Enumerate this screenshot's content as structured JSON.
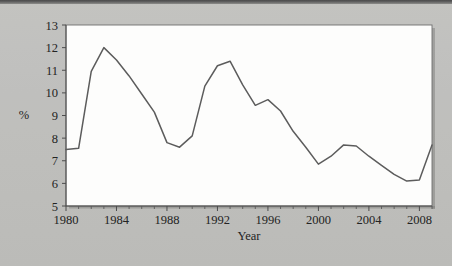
{
  "figure": {
    "background_color": "#bcbcb9",
    "plot_background_color": "#fdfdfc",
    "line_color": "#5c5c5c",
    "axis_color": "#4d4d4d"
  },
  "chart_data": {
    "type": "line",
    "title": "",
    "subtitle": "",
    "xlabel": "Year",
    "ylabel": "%",
    "xlim": [
      1980,
      2009
    ],
    "ylim": [
      5,
      13
    ],
    "grid": false,
    "legend": false,
    "legend_position": "none",
    "y_ticks": [
      5,
      6,
      7,
      8,
      9,
      10,
      11,
      12,
      13
    ],
    "y_tick_labels": [
      "5",
      "6",
      "7",
      "8",
      "9",
      "10",
      "11",
      "12",
      "13"
    ],
    "x_ticks": [
      1980,
      1984,
      1988,
      1992,
      1996,
      2000,
      2004,
      2008
    ],
    "x_tick_labels": [
      "1980",
      "1984",
      "1988",
      "1992",
      "1996",
      "2000",
      "2004",
      "2008"
    ],
    "x_minor_tick_interval": 1,
    "x": [
      1980,
      1981,
      1982,
      1983,
      1984,
      1985,
      1986,
      1987,
      1988,
      1989,
      1990,
      1991,
      1992,
      1993,
      1994,
      1995,
      1996,
      1997,
      1998,
      1999,
      2000,
      2001,
      2002,
      2003,
      2004,
      2005,
      2006,
      2007,
      2008,
      2009
    ],
    "values": [
      7.5,
      7.55,
      10.95,
      12.0,
      11.45,
      10.75,
      9.95,
      9.15,
      7.8,
      7.6,
      8.1,
      10.3,
      11.2,
      11.4,
      10.35,
      9.45,
      9.7,
      9.2,
      8.3,
      7.6,
      6.85,
      7.2,
      7.7,
      7.65,
      7.2,
      6.8,
      6.4,
      6.1,
      6.15,
      7.7
    ],
    "series": [
      {
        "name": "Unemployment rate",
        "values": [
          7.5,
          7.55,
          10.95,
          12.0,
          11.45,
          10.75,
          9.95,
          9.15,
          7.8,
          7.6,
          8.1,
          10.3,
          11.2,
          11.4,
          10.35,
          9.45,
          9.7,
          9.2,
          8.3,
          7.6,
          6.85,
          7.2,
          7.7,
          7.65,
          7.2,
          6.8,
          6.4,
          6.1,
          6.15,
          7.7
        ]
      }
    ]
  }
}
